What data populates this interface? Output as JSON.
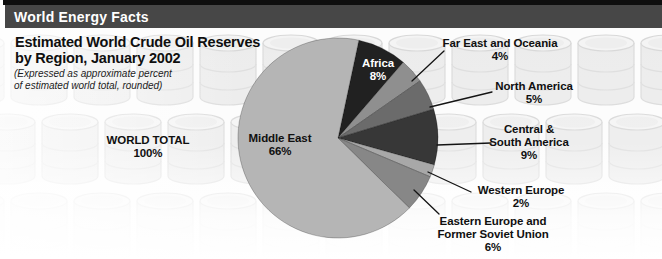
{
  "header": {
    "title": "World Energy Facts"
  },
  "chart": {
    "title_lines": [
      "Estimated World Crude Oil Reserves",
      "by Region, January 2002"
    ],
    "subtitle_lines": [
      "(Expressed as approximate percent",
      "of estimated world total, rounded)"
    ]
  },
  "chart_data": {
    "type": "pie",
    "title": "Estimated World Crude Oil Reserves by Region, January 2002",
    "subtitle": "(Expressed as approximate percent of estimated world total, rounded)",
    "unit": "percent of estimated world total",
    "direction": "clockwise",
    "rotation_deg": 12,
    "legend_position": "callout-labels",
    "categories": [
      "Africa",
      "Far East and Oceania",
      "North America",
      "Central & South America",
      "Western Europe",
      "Eastern Europe and Former Soviet Union",
      "Middle East"
    ],
    "values": [
      8,
      4,
      5,
      9,
      2,
      6,
      66
    ],
    "total": {
      "label": "WORLD TOTAL",
      "value_text": "100%"
    },
    "slices": [
      {
        "name": "Africa",
        "name_lines": [
          "Africa"
        ],
        "value": 8,
        "value_text": "8%",
        "color": "#212121",
        "label_position": "inside"
      },
      {
        "name": "Far East and Oceania",
        "name_lines": [
          "Far East and Oceania"
        ],
        "value": 4,
        "value_text": "4%",
        "color": "#8f8f8f",
        "label_position": "outside"
      },
      {
        "name": "North America",
        "name_lines": [
          "North America"
        ],
        "value": 5,
        "value_text": "5%",
        "color": "#6b6b6b",
        "label_position": "outside"
      },
      {
        "name": "Central & South America",
        "name_lines": [
          "Central &",
          "South America"
        ],
        "value": 9,
        "value_text": "9%",
        "color": "#373737",
        "label_position": "outside"
      },
      {
        "name": "Western Europe",
        "name_lines": [
          "Western Europe"
        ],
        "value": 2,
        "value_text": "2%",
        "color": "#a8a8a8",
        "label_position": "outside"
      },
      {
        "name": "Eastern Europe and Former Soviet Union",
        "name_lines": [
          "Eastern Europe and",
          "Former Soviet Union"
        ],
        "value": 6,
        "value_text": "6%",
        "color": "#878787",
        "label_position": "outside"
      },
      {
        "name": "Middle East",
        "name_lines": [
          "Middle East"
        ],
        "value": 66,
        "value_text": "66%",
        "color": "#b5b5b5",
        "label_position": "inside"
      }
    ]
  }
}
